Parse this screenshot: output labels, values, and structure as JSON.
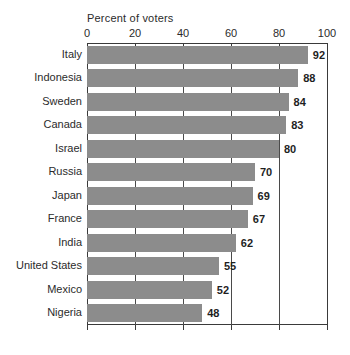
{
  "chart_data": {
    "type": "bar",
    "orientation": "horizontal",
    "title": "Percent of voters",
    "xlabel": "Percent of voters",
    "ylabel": "",
    "xlim": [
      0,
      100
    ],
    "xticks": [
      0,
      20,
      40,
      60,
      80,
      100
    ],
    "grid": true,
    "legend": false,
    "bar_color": "#8c8c8c",
    "axis_color": "#3a3a3a",
    "categories": [
      "Italy",
      "Indonesia",
      "Sweden",
      "Canada",
      "Israel",
      "Russia",
      "Japan",
      "France",
      "India",
      "United States",
      "Mexico",
      "Nigeria"
    ],
    "values": [
      92,
      88,
      84,
      83,
      80,
      70,
      69,
      67,
      62,
      55,
      52,
      48
    ],
    "value_labels": [
      "92",
      "88",
      "84",
      "83",
      "80",
      "70",
      "69",
      "67",
      "62",
      "55",
      "52",
      "48"
    ],
    "tick_labels": [
      "0",
      "20",
      "40",
      "60",
      "80",
      "100"
    ]
  }
}
